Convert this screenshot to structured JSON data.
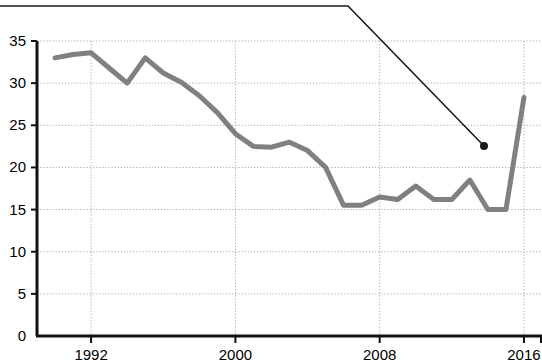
{
  "chart_data": {
    "type": "line",
    "title": "",
    "subtitle": "",
    "xlabel": "",
    "ylabel": "",
    "xlim": [
      1989,
      2017
    ],
    "ylim": [
      0,
      35
    ],
    "grid": true,
    "legend": "none",
    "x_ticks": [
      1992,
      2000,
      2008,
      2016
    ],
    "x_tick_labels": [
      "1992",
      "2000",
      "2008",
      "2016"
    ],
    "y_ticks": [
      0,
      5,
      10,
      15,
      20,
      25,
      30,
      35
    ],
    "y_tick_labels": [
      "0",
      "5",
      "10",
      "15",
      "20",
      "25",
      "30",
      "35"
    ],
    "series": [
      {
        "name": "main-series",
        "color": "#808080",
        "x": [
          1990,
          1991,
          1992,
          1993,
          1994,
          1995,
          1996,
          1997,
          1998,
          1999,
          2000,
          2001,
          2002,
          2003,
          2004,
          2005,
          2006,
          2007,
          2008,
          2009,
          2010,
          2011,
          2012,
          2013,
          2014,
          2015,
          2016
        ],
        "values": [
          33.0,
          33.4,
          33.6,
          31.8,
          30.0,
          33.0,
          31.2,
          30.1,
          28.5,
          26.5,
          24.0,
          22.5,
          22.4,
          23.0,
          22.0,
          20.0,
          15.5,
          15.5,
          16.5,
          16.2,
          17.8,
          16.2,
          16.2,
          18.5,
          15.0,
          15.0,
          28.3
        ]
      }
    ],
    "annotation": {
      "name": "pointer-line",
      "color": "#1a1a1a",
      "points": [
        {
          "x_px": 0,
          "y_px": 6
        },
        {
          "x_px": 348,
          "y_px": 6
        },
        {
          "x_px": 484,
          "y_px": 146
        }
      ],
      "marker": {
        "x_px": 484,
        "y_px": 146,
        "radius": 4,
        "value_estimate": 22.5
      }
    },
    "axes_geometry": {
      "plot_left_px": 37,
      "plot_right_px": 542,
      "plot_top_px": 41,
      "plot_bottom_px": 336
    }
  }
}
